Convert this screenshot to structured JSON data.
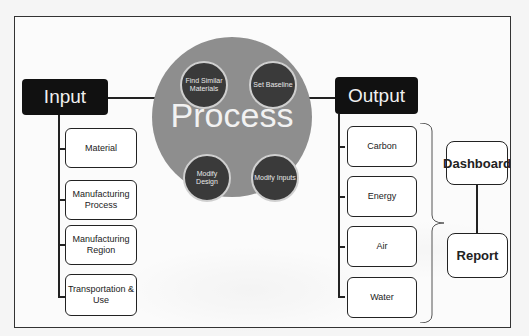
{
  "diagram": {
    "input": {
      "title": "Input",
      "items": [
        {
          "label": "Material"
        },
        {
          "label": "Manufacturing Process"
        },
        {
          "label": "Manufacturing Region"
        },
        {
          "label": "Transportation & Use"
        }
      ]
    },
    "process": {
      "title": "Process",
      "steps": [
        {
          "label": "Find Similar Materials"
        },
        {
          "label": "Set Baseline"
        },
        {
          "label": "Modify Design"
        },
        {
          "label": "Modify Inputs"
        }
      ]
    },
    "output": {
      "title": "Output",
      "items": [
        {
          "label": "Carbon"
        },
        {
          "label": "Energy"
        },
        {
          "label": "Air"
        },
        {
          "label": "Water"
        }
      ]
    },
    "results": {
      "dashboard": "Dashboard",
      "report": "Report"
    },
    "colors": {
      "header_fill": "#111111",
      "process_circle": "#8e8e8e",
      "step_circle": "#3a3a3a",
      "box_border": "#222222"
    }
  }
}
